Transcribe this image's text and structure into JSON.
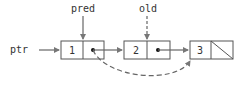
{
  "diagram": {
    "type": "linked-list-deletion",
    "colors": {
      "stroke": "#555555",
      "arrow": "#777777",
      "text": "#333333",
      "background": "#ffffff"
    },
    "labels": {
      "head_pointer": "ptr",
      "pred_pointer": "pred",
      "old_pointer": "old"
    },
    "nodes": [
      {
        "id": "node-1",
        "value": "1",
        "next": "dot"
      },
      {
        "id": "node-2",
        "value": "2",
        "next": "dot"
      },
      {
        "id": "node-3",
        "value": "3",
        "next": "null-slash"
      }
    ],
    "edges": [
      {
        "from": "ptr",
        "to": "node-1",
        "style": "solid"
      },
      {
        "from": "pred",
        "to": "node-1",
        "style": "solid"
      },
      {
        "from": "old",
        "to": "node-2",
        "style": "dashed"
      },
      {
        "from": "node-1",
        "to": "node-2",
        "style": "solid"
      },
      {
        "from": "node-2",
        "to": "node-3",
        "style": "solid"
      },
      {
        "from": "node-1",
        "to": "node-3",
        "style": "dashed-curve"
      }
    ]
  }
}
